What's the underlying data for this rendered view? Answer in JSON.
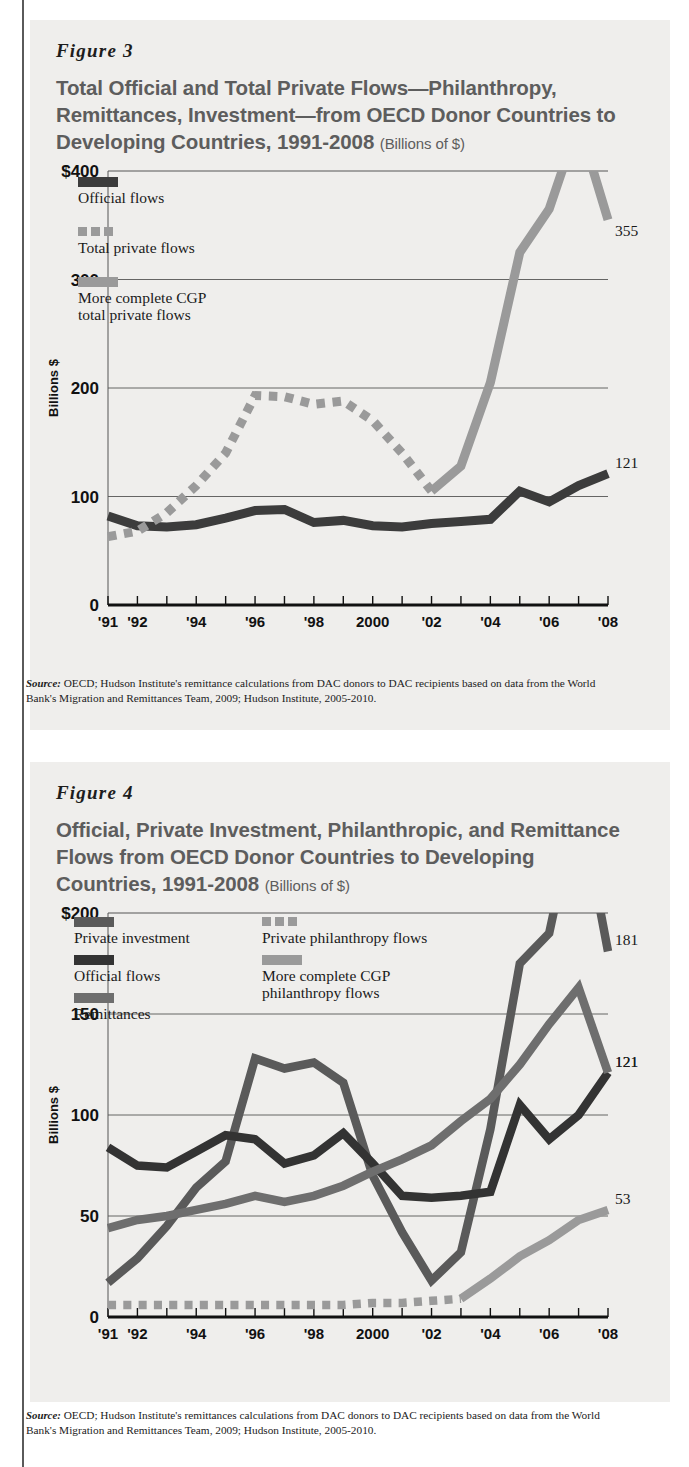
{
  "page": {
    "background": "#ffffff",
    "panel_background": "#efeeec"
  },
  "figures": [
    {
      "id": "figure-3",
      "label": "Figure 3",
      "title": "Total Official and Total Private Flows—Philanthropy, Remittances, Investment—from OECD Donor Countries to Developing Countries, 1991-2008",
      "units": "(Billions of $)",
      "source": "OECD; Hudson Institute's remittance calculations from DAC donors to DAC recipients based on data from the World Bank's Migration and Remittances Team, 2009; Hudson Institute, 2005-2010.",
      "source_prefix": "Source:",
      "chart_data": {
        "type": "line",
        "title": "Total Official and Total Private Flows—Philanthropy, Remittances, Investment—from OECD Donor Countries to Developing Countries, 1991-2008",
        "ylabel": "Billions $",
        "xlabel": "",
        "ylim": [
          0,
          400
        ],
        "yticks": [
          0,
          100,
          200,
          300,
          400
        ],
        "ytick_labels": [
          "0",
          "100",
          "200",
          "300",
          "$400"
        ],
        "grid": true,
        "legend_position": "inside-top-left",
        "x": [
          1991,
          1992,
          1993,
          1994,
          1995,
          1996,
          1997,
          1998,
          1999,
          2000,
          2001,
          2002,
          2003,
          2004,
          2005,
          2006,
          2007,
          2008
        ],
        "xtick_labels": [
          "'91",
          "'92",
          "",
          "'94",
          "",
          "'96",
          "",
          "'98",
          "",
          "2000",
          "",
          "'02",
          "",
          "'04",
          "",
          "'06",
          "",
          "'08"
        ],
        "series": [
          {
            "name": "Official flows",
            "color": "#3c3c3c",
            "style": "solid",
            "values": [
              82,
              73,
              72,
              74,
              80,
              87,
              88,
              76,
              78,
              73,
              72,
              75,
              77,
              79,
              105,
              95,
              110,
              121
            ],
            "end_label": "121"
          },
          {
            "name": "Total private flows",
            "color": "#9a9a9a",
            "style": "dashed",
            "values": [
              63,
              68,
              85,
              110,
              140,
              193,
              192,
              185,
              188,
              170,
              140,
              105,
              null,
              null,
              null,
              null,
              null,
              null
            ],
            "end_label": ""
          },
          {
            "name": "More complete CGP total private flows",
            "color": "#9a9a9a",
            "style": "solid",
            "values": [
              null,
              null,
              null,
              null,
              null,
              null,
              null,
              null,
              null,
              null,
              null,
              105,
              128,
              205,
              325,
              365,
              445,
              355
            ],
            "end_label": "355"
          }
        ],
        "legend": [
          {
            "label": "Official flows",
            "color": "#3c3c3c",
            "style": "solid"
          },
          {
            "label": "Total private flows",
            "color": "#9a9a9a",
            "style": "dashed"
          },
          {
            "label": "More complete CGP",
            "label2": "total private flows",
            "color": "#9a9a9a",
            "style": "solid"
          }
        ]
      }
    },
    {
      "id": "figure-4",
      "label": "Figure 4",
      "title": "Official, Private Investment, Philanthropic, and Remittance Flows from OECD Donor Countries to Developing Countries, 1991-2008",
      "units": "(Billions of $)",
      "source": "OECD; Hudson Institute's remittances calculations from DAC donors to DAC recipients based on data from the World Bank's Migration and Remittances Team, 2009; Hudson Institute, 2005-2010.",
      "source_prefix": "Source:",
      "chart_data": {
        "type": "line",
        "title": "Official, Private Investment, Philanthropic, and Remittance Flows from OECD Donor Countries to Developing Countries, 1991-2008",
        "ylabel": "Billions $",
        "xlabel": "",
        "ylim": [
          0,
          200
        ],
        "yticks": [
          0,
          50,
          100,
          150,
          200
        ],
        "ytick_labels": [
          "0",
          "50",
          "100",
          "150",
          "$200"
        ],
        "grid": true,
        "legend_position": "inside-top",
        "x": [
          1991,
          1992,
          1993,
          1994,
          1995,
          1996,
          1997,
          1998,
          1999,
          2000,
          2001,
          2002,
          2003,
          2004,
          2005,
          2006,
          2007,
          2008
        ],
        "xtick_labels": [
          "'91",
          "'92",
          "",
          "'94",
          "",
          "'96",
          "",
          "'98",
          "",
          "2000",
          "",
          "'02",
          "",
          "'04",
          "",
          "'06",
          "",
          "'08"
        ],
        "series": [
          {
            "name": "Private investment",
            "color": "#5a5a5a",
            "style": "solid",
            "values": [
              17,
              29,
              45,
              64,
              77,
              128,
              123,
              126,
              116,
              70,
              42,
              18,
              32,
              93,
              175,
              190,
              258,
              181
            ],
            "end_label": "181"
          },
          {
            "name": "Official flows",
            "color": "#333333",
            "style": "solid",
            "values": [
              84,
              75,
              74,
              82,
              90,
              88,
              76,
              80,
              91,
              76,
              60,
              59,
              60,
              62,
              105,
              88,
              100,
              121
            ],
            "end_label": "121"
          },
          {
            "name": "Remittances",
            "color": "#6e6e6e",
            "style": "solid",
            "values": [
              44,
              48,
              50,
              53,
              56,
              60,
              57,
              60,
              65,
              72,
              78,
              85,
              97,
              108,
              125,
              145,
              163,
              121
            ],
            "end_label": "121"
          },
          {
            "name": "Private philanthropy flows",
            "color": "#9a9a9a",
            "style": "dashed",
            "values": [
              6,
              6,
              6,
              6,
              6,
              6,
              6,
              6,
              6,
              7,
              7,
              8,
              9,
              null,
              null,
              null,
              null,
              null
            ],
            "end_label": ""
          },
          {
            "name": "More complete CGP philanthropy flows",
            "color": "#9a9a9a",
            "style": "solid",
            "values": [
              null,
              null,
              null,
              null,
              null,
              null,
              null,
              null,
              null,
              null,
              null,
              null,
              9,
              19,
              30,
              38,
              48,
              53
            ],
            "end_label": "53"
          }
        ],
        "legend": [
          {
            "label": "Private investment",
            "color": "#5a5a5a",
            "style": "solid"
          },
          {
            "label": "Official flows",
            "color": "#333333",
            "style": "solid"
          },
          {
            "label": "Remittances",
            "color": "#6e6e6e",
            "style": "solid"
          },
          {
            "label": "Private philanthropy flows",
            "color": "#9a9a9a",
            "style": "dashed"
          },
          {
            "label": "More complete CGP",
            "label2": "philanthropy flows",
            "color": "#9a9a9a",
            "style": "solid"
          }
        ]
      }
    }
  ]
}
